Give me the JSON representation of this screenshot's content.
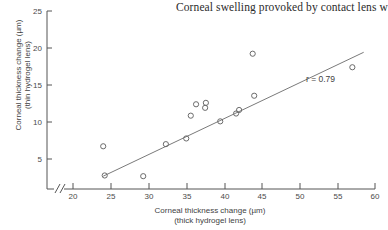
{
  "title": "Corneal swelling provoked by contact lens w",
  "annotation": {
    "correlation_label": "r = 0.79"
  },
  "axes": {
    "x": {
      "title_line1": "Corneal thickness change (µm)",
      "title_line2": "(thick hydrogel lens)",
      "ticks": [
        "20",
        "25",
        "30",
        "35",
        "40",
        "45",
        "50",
        "55",
        "60"
      ],
      "break_marker": "//"
    },
    "y": {
      "title_line1": "Corneal thickness change (µm)",
      "title_line2": "(thin hydrogel lens)",
      "ticks": [
        "5",
        "10",
        "15",
        "20",
        "25"
      ]
    }
  },
  "colors": {
    "axis": "#555555",
    "marker": "#6b6b6b",
    "fit_line": "#7a7a7a",
    "text": "#3a3a3a",
    "background": "#ffffff"
  },
  "chart_data": {
    "type": "scatter",
    "title": "Corneal swelling provoked by contact lens w",
    "xlabel": "Corneal thickness change (µm) (thick hydrogel lens)",
    "ylabel": "Corneal thickness change (µm) (thin hydrogel lens)",
    "xlim": [
      20,
      60
    ],
    "ylim": [
      0,
      25
    ],
    "xticks": [
      20,
      25,
      30,
      35,
      40,
      45,
      50,
      55,
      60
    ],
    "yticks": [
      5,
      10,
      15,
      20,
      25
    ],
    "grid": false,
    "legend": null,
    "axis_break_x": true,
    "marker_style": "open-circle",
    "correlation": 0.79,
    "annotations": [
      {
        "text": "r = 0.79",
        "x": 47.5,
        "y": 13.2
      }
    ],
    "fit_line": {
      "x": [
        24.0,
        58.5
      ],
      "y": [
        1.8,
        19.2
      ]
    },
    "points": [
      {
        "x": 24.0,
        "y": 6.0
      },
      {
        "x": 24.2,
        "y": 1.9
      },
      {
        "x": 29.3,
        "y": 1.8
      },
      {
        "x": 32.3,
        "y": 6.3
      },
      {
        "x": 35.0,
        "y": 7.1
      },
      {
        "x": 35.6,
        "y": 10.3
      },
      {
        "x": 36.3,
        "y": 11.9
      },
      {
        "x": 37.5,
        "y": 11.4
      },
      {
        "x": 37.6,
        "y": 12.1
      },
      {
        "x": 39.5,
        "y": 9.5
      },
      {
        "x": 41.6,
        "y": 10.6
      },
      {
        "x": 42.0,
        "y": 11.1
      },
      {
        "x": 43.8,
        "y": 19.0
      },
      {
        "x": 44.0,
        "y": 13.1
      },
      {
        "x": 57.0,
        "y": 17.1
      }
    ]
  }
}
